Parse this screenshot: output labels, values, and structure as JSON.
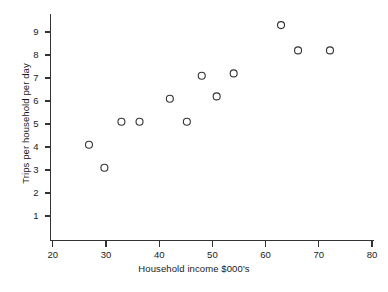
{
  "chart_data": {
    "type": "scatter",
    "title": "",
    "xlabel": "Household income $000's",
    "ylabel": "Trips per household per day",
    "xlim": [
      20,
      80
    ],
    "ylim": [
      0,
      9.8
    ],
    "xticks": [
      20,
      30,
      40,
      50,
      60,
      70,
      80
    ],
    "yticks": [
      1,
      2,
      3,
      4,
      5,
      6,
      7,
      8,
      9
    ],
    "grid": false,
    "legend": false,
    "marker": "open-circle",
    "marker_color": "#333333",
    "axis_color": "#333333",
    "points": [
      {
        "x": 26.8,
        "y": 4.1
      },
      {
        "x": 29.7,
        "y": 3.1
      },
      {
        "x": 32.9,
        "y": 5.1
      },
      {
        "x": 36.3,
        "y": 5.1
      },
      {
        "x": 42.0,
        "y": 6.1
      },
      {
        "x": 45.2,
        "y": 5.1
      },
      {
        "x": 48.0,
        "y": 7.1
      },
      {
        "x": 50.8,
        "y": 6.2
      },
      {
        "x": 54.0,
        "y": 7.2
      },
      {
        "x": 62.9,
        "y": 9.3
      },
      {
        "x": 66.1,
        "y": 8.2
      },
      {
        "x": 72.1,
        "y": 8.2
      }
    ]
  },
  "axes": {
    "x_tick_labels": [
      "20",
      "30",
      "40",
      "50",
      "60",
      "70",
      "80"
    ],
    "y_tick_labels": [
      "1",
      "2",
      "3",
      "4",
      "5",
      "6",
      "7",
      "8",
      "9"
    ]
  }
}
